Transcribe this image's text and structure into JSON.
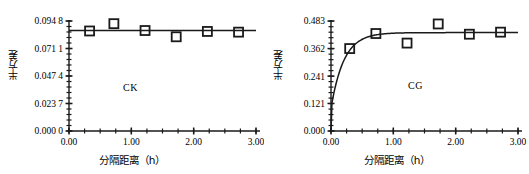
{
  "figure": {
    "background": "#ffffff",
    "axis_color": "#1a1a1a",
    "marker_color": "#1a1a1a",
    "marker_fill": "#ffffff"
  },
  "chart_data": [
    {
      "type": "scatter",
      "panel": "left",
      "title": "",
      "annotation": "CK",
      "xlabel": "分隔距离（h）",
      "ylabel": "半方差",
      "xlim": [
        0.0,
        3.0
      ],
      "ylim": [
        0.0,
        0.0948
      ],
      "grid": false,
      "legend": "none",
      "xticklabels": [
        "0.00",
        "1.00",
        "2.00",
        "3.00"
      ],
      "xtickvalues": [
        0.0,
        1.0,
        2.0,
        3.0
      ],
      "yticklabels": [
        "0.000 0",
        "0.023 7",
        "0.047 4",
        "0.071 1",
        "0.094 8"
      ],
      "ytickvalues": [
        0.0,
        0.0237,
        0.0474,
        0.0711,
        0.0948
      ],
      "x_minor_tick_step": 0.25,
      "y_minor_tick_step": 0.00474,
      "series": [
        {
          "name": "observed semivariance",
          "marker": "open-square",
          "x": [
            0.33,
            0.72,
            1.22,
            1.72,
            2.22,
            2.72
          ],
          "y": [
            0.0862,
            0.0925,
            0.0866,
            0.0812,
            0.0858,
            0.0852
          ]
        },
        {
          "name": "fitted model (pure nugget)",
          "marker": "line",
          "x": [
            0.0,
            3.0
          ],
          "y": [
            0.0866,
            0.0866
          ]
        }
      ]
    },
    {
      "type": "scatter",
      "panel": "right",
      "title": "",
      "annotation": "CG",
      "xlabel": "分隔距离（h）",
      "ylabel": "半方差",
      "xlim": [
        0.0,
        3.0
      ],
      "ylim": [
        0.0,
        0.483
      ],
      "grid": false,
      "legend": "none",
      "xticklabels": [
        "0.00",
        "1.00",
        "2.00",
        "3.00"
      ],
      "xtickvalues": [
        0.0,
        1.0,
        2.0,
        3.0
      ],
      "yticklabels": [
        "0.000",
        "0.121",
        "0.241",
        "0.362",
        "0.483"
      ],
      "ytickvalues": [
        0.0,
        0.121,
        0.241,
        0.362,
        0.483
      ],
      "x_minor_tick_step": 0.25,
      "y_minor_tick_step": 0.0241,
      "series": [
        {
          "name": "observed semivariance",
          "marker": "open-square",
          "x": [
            0.3,
            0.72,
            1.22,
            1.72,
            2.22,
            2.72
          ],
          "y": [
            0.362,
            0.428,
            0.386,
            0.47,
            0.425,
            0.434
          ]
        },
        {
          "name": "fitted model (exponential)",
          "marker": "curve",
          "nugget": 0.1,
          "sill": 0.432,
          "range": 0.62,
          "x": [
            0.0,
            3.0
          ]
        }
      ]
    }
  ]
}
